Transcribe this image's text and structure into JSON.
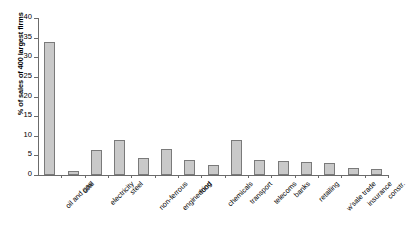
{
  "chart_data": {
    "type": "bar",
    "title": "",
    "xlabel": "",
    "ylabel": "% of sales of 400 largest firms",
    "ylim": [
      0,
      40
    ],
    "yticks": [
      0,
      5,
      10,
      15,
      20,
      25,
      30,
      35,
      40
    ],
    "grid": false,
    "legend": false,
    "bar_fill_color": "#c9c9c9",
    "bar_border_color": "#7a7a7a",
    "axis_color": "#6b6b6b",
    "categories": [
      "oil and gas",
      "coal",
      "electricity",
      "steel",
      "non-ferrous",
      "engineering",
      "food",
      "chemicals",
      "transport",
      "telecoms",
      "banks",
      "retailing",
      "w'sale trade",
      "insurance",
      "constr."
    ],
    "values": [
      34,
      1,
      6.3,
      9,
      4.3,
      6.6,
      3.8,
      2.5,
      9,
      3.7,
      3.5,
      3.4,
      3,
      1.7,
      1.6
    ]
  }
}
